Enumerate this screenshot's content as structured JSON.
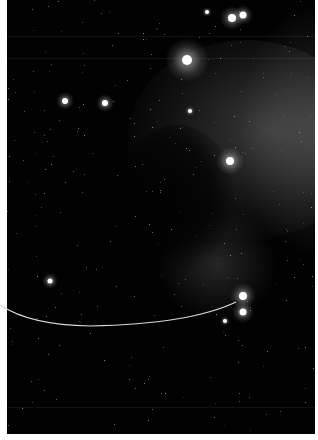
{
  "image": {
    "subject": "Horsehead Nebula star field",
    "background_color": "#020202",
    "border_color": "#ffffff"
  },
  "bright_stars": [
    {
      "x": 187,
      "y": 60,
      "r": 5,
      "glow": 22
    },
    {
      "x": 232,
      "y": 18,
      "r": 4,
      "glow": 12
    },
    {
      "x": 243,
      "y": 15,
      "r": 3.5,
      "glow": 10
    },
    {
      "x": 230,
      "y": 161,
      "r": 4,
      "glow": 14
    },
    {
      "x": 243,
      "y": 296,
      "r": 4,
      "glow": 13
    },
    {
      "x": 243,
      "y": 312,
      "r": 3.5,
      "glow": 11
    },
    {
      "x": 65,
      "y": 101,
      "r": 3,
      "glow": 9
    },
    {
      "x": 105,
      "y": 103,
      "r": 3,
      "glow": 9
    },
    {
      "x": 50,
      "y": 281,
      "r": 2.5,
      "glow": 8
    },
    {
      "x": 207,
      "y": 12,
      "r": 2,
      "glow": 5
    },
    {
      "x": 190,
      "y": 111,
      "r": 2,
      "glow": 5
    },
    {
      "x": 225,
      "y": 321,
      "r": 2,
      "glow": 5
    }
  ],
  "pointer_line": {
    "color": "#d8d8d8",
    "path": "M0 305 Q 30 325 90 326 Q 190 324 236 302"
  }
}
